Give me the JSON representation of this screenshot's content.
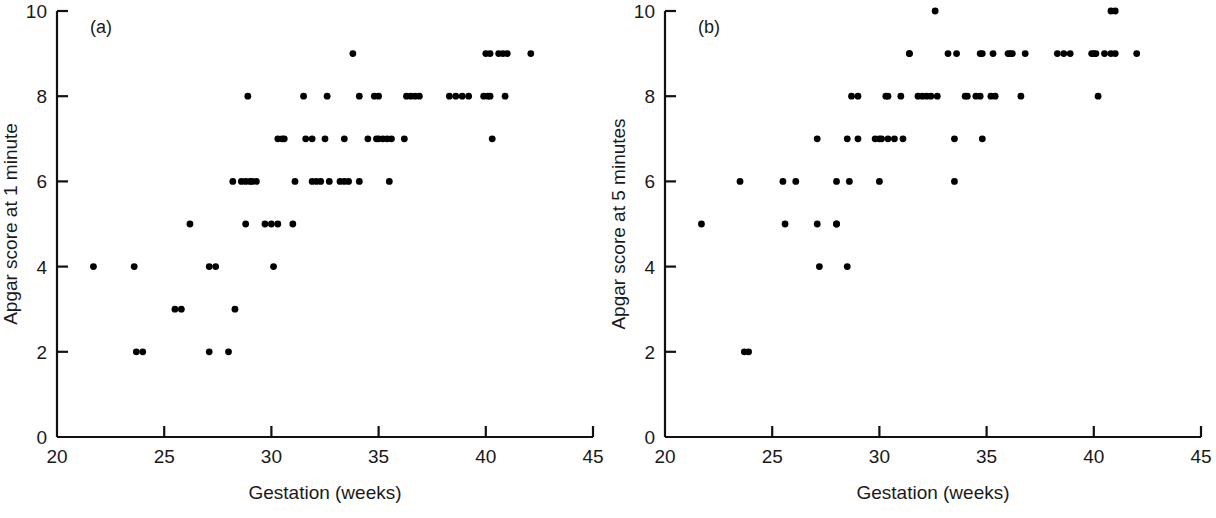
{
  "figure": {
    "background": "#ffffff",
    "ink_color": "#111111",
    "point_color": "#000000"
  },
  "chart_data": [
    {
      "type": "scatter",
      "panel_label": "(a)",
      "title": "",
      "xlabel": "Gestation (weeks)",
      "ylabel": "Apgar score at 1 minute",
      "xlim": [
        20,
        45
      ],
      "ylim": [
        0,
        10
      ],
      "xticks": [
        20,
        25,
        30,
        35,
        40,
        45
      ],
      "yticks": [
        0,
        2,
        4,
        6,
        8,
        10
      ],
      "xticklabels": [
        "20",
        "25",
        "30",
        "35",
        "40",
        "45"
      ],
      "yticklabels": [
        "0",
        "2",
        "4",
        "6",
        "8",
        "10"
      ],
      "grid": false,
      "legend": null,
      "marker": "filled-circle",
      "points": [
        [
          21.7,
          4
        ],
        [
          23.6,
          4
        ],
        [
          27.1,
          4
        ],
        [
          27.4,
          4
        ],
        [
          30.1,
          4
        ],
        [
          23.7,
          2
        ],
        [
          24.0,
          2
        ],
        [
          27.1,
          2
        ],
        [
          28.0,
          2
        ],
        [
          25.5,
          3
        ],
        [
          25.8,
          3
        ],
        [
          28.3,
          3
        ],
        [
          26.2,
          5
        ],
        [
          28.8,
          5
        ],
        [
          29.7,
          5
        ],
        [
          30.0,
          5
        ],
        [
          30.3,
          5
        ],
        [
          31.0,
          5
        ],
        [
          28.2,
          6
        ],
        [
          28.6,
          6
        ],
        [
          28.8,
          6
        ],
        [
          29.0,
          6
        ],
        [
          29.1,
          6
        ],
        [
          29.3,
          6
        ],
        [
          31.1,
          6
        ],
        [
          31.9,
          6
        ],
        [
          32.1,
          6
        ],
        [
          32.3,
          6
        ],
        [
          32.7,
          6
        ],
        [
          33.2,
          6
        ],
        [
          33.4,
          6
        ],
        [
          33.6,
          6
        ],
        [
          34.1,
          6
        ],
        [
          35.5,
          6
        ],
        [
          30.3,
          7
        ],
        [
          30.5,
          7
        ],
        [
          30.6,
          7
        ],
        [
          31.6,
          7
        ],
        [
          31.9,
          7
        ],
        [
          32.5,
          7
        ],
        [
          33.4,
          7
        ],
        [
          34.5,
          7
        ],
        [
          34.9,
          7
        ],
        [
          35.0,
          7
        ],
        [
          35.2,
          7
        ],
        [
          35.4,
          7
        ],
        [
          35.6,
          7
        ],
        [
          36.2,
          7
        ],
        [
          40.3,
          7
        ],
        [
          28.9,
          8
        ],
        [
          31.5,
          8
        ],
        [
          32.6,
          8
        ],
        [
          34.1,
          8
        ],
        [
          34.8,
          8
        ],
        [
          35.0,
          8
        ],
        [
          36.3,
          8
        ],
        [
          36.5,
          8
        ],
        [
          36.7,
          8
        ],
        [
          36.9,
          8
        ],
        [
          38.3,
          8
        ],
        [
          38.6,
          8
        ],
        [
          38.9,
          8
        ],
        [
          39.2,
          8
        ],
        [
          39.9,
          8
        ],
        [
          40.1,
          8
        ],
        [
          40.2,
          8
        ],
        [
          40.9,
          8
        ],
        [
          33.8,
          9
        ],
        [
          40.0,
          9
        ],
        [
          40.2,
          9
        ],
        [
          40.6,
          9
        ],
        [
          40.8,
          9
        ],
        [
          41.0,
          9
        ],
        [
          42.1,
          9
        ]
      ]
    },
    {
      "type": "scatter",
      "panel_label": "(b)",
      "title": "",
      "xlabel": "Gestation (weeks)",
      "ylabel": "Apgar score at 5 minutes",
      "xlim": [
        20,
        45
      ],
      "ylim": [
        0,
        10
      ],
      "xticks": [
        20,
        25,
        30,
        35,
        40,
        45
      ],
      "yticks": [
        0,
        2,
        4,
        6,
        8,
        10
      ],
      "xticklabels": [
        "20",
        "25",
        "30",
        "35",
        "40",
        "45"
      ],
      "yticklabels": [
        "0",
        "2",
        "4",
        "6",
        "8",
        "10"
      ],
      "grid": false,
      "legend": null,
      "marker": "filled-circle",
      "points": [
        [
          23.7,
          2
        ],
        [
          23.9,
          2
        ],
        [
          27.2,
          4
        ],
        [
          28.5,
          4
        ],
        [
          21.7,
          5
        ],
        [
          25.6,
          5
        ],
        [
          27.1,
          5
        ],
        [
          28.0,
          5
        ],
        [
          28.0,
          5
        ],
        [
          23.5,
          6
        ],
        [
          25.5,
          6
        ],
        [
          26.1,
          6
        ],
        [
          28.0,
          6
        ],
        [
          28.6,
          6
        ],
        [
          30.0,
          6
        ],
        [
          33.5,
          6
        ],
        [
          27.1,
          7
        ],
        [
          28.5,
          7
        ],
        [
          29.0,
          7
        ],
        [
          29.8,
          7
        ],
        [
          30.0,
          7
        ],
        [
          30.1,
          7
        ],
        [
          30.4,
          7
        ],
        [
          30.7,
          7
        ],
        [
          31.1,
          7
        ],
        [
          33.5,
          7
        ],
        [
          34.8,
          7
        ],
        [
          28.7,
          8
        ],
        [
          29.0,
          8
        ],
        [
          30.3,
          8
        ],
        [
          30.4,
          8
        ],
        [
          31.0,
          8
        ],
        [
          31.8,
          8
        ],
        [
          32.0,
          8
        ],
        [
          32.2,
          8
        ],
        [
          32.4,
          8
        ],
        [
          32.7,
          8
        ],
        [
          34.0,
          8
        ],
        [
          34.1,
          8
        ],
        [
          34.5,
          8
        ],
        [
          34.7,
          8
        ],
        [
          35.2,
          8
        ],
        [
          35.4,
          8
        ],
        [
          36.6,
          8
        ],
        [
          40.2,
          8
        ],
        [
          31.4,
          9
        ],
        [
          31.4,
          9
        ],
        [
          33.2,
          9
        ],
        [
          33.6,
          9
        ],
        [
          34.7,
          9
        ],
        [
          34.8,
          9
        ],
        [
          35.3,
          9
        ],
        [
          36.0,
          9
        ],
        [
          36.1,
          9
        ],
        [
          36.2,
          9
        ],
        [
          36.8,
          9
        ],
        [
          38.3,
          9
        ],
        [
          38.6,
          9
        ],
        [
          38.9,
          9
        ],
        [
          39.9,
          9
        ],
        [
          40.0,
          9
        ],
        [
          40.1,
          9
        ],
        [
          40.5,
          9
        ],
        [
          40.8,
          9
        ],
        [
          41.0,
          9
        ],
        [
          42.0,
          9
        ],
        [
          32.6,
          10
        ],
        [
          40.8,
          10
        ],
        [
          41.0,
          10
        ]
      ]
    }
  ]
}
